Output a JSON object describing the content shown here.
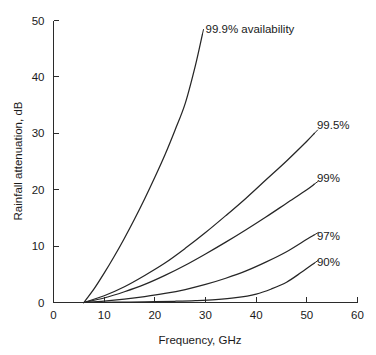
{
  "chart_data": {
    "type": "line",
    "title": "",
    "xlabel": "Frequency, GHz",
    "ylabel": "Rainfall attenuation, dB",
    "xlim": [
      0,
      60
    ],
    "ylim": [
      0,
      50
    ],
    "xticks": [
      0,
      10,
      20,
      30,
      40,
      50,
      60
    ],
    "yticks": [
      0,
      10,
      20,
      30,
      40,
      50
    ],
    "xtick_labels": [
      "0",
      "10",
      "20",
      "30",
      "40",
      "50",
      "60"
    ],
    "ytick_labels": [
      "0",
      "10",
      "20",
      "30",
      "40",
      "50"
    ],
    "grid": false,
    "legend_position": "inline-annotations",
    "series": [
      {
        "name": "99.9% availability",
        "label": "99.9% availability",
        "label_x": 30.0,
        "label_y": 48.5,
        "x": [
          6.0,
          8.0,
          10.0,
          12.0,
          14.0,
          16.0,
          18.0,
          20.0,
          22.0,
          24.0,
          26.0,
          28.0,
          29.4
        ],
        "y": [
          0.0,
          2.4,
          5.2,
          8.2,
          11.4,
          14.8,
          18.4,
          22.2,
          26.2,
          30.6,
          35.3,
          42.0,
          47.6
        ]
      },
      {
        "name": "99.5%",
        "label": "99.5%",
        "label_x": 52.0,
        "label_y": 31.5,
        "x": [
          6.0,
          10.0,
          14.0,
          18.0,
          22.0,
          26.0,
          30.0,
          34.0,
          38.0,
          42.0,
          46.0,
          50.0,
          51.5
        ],
        "y": [
          0.0,
          1.2,
          2.8,
          4.8,
          7.0,
          9.6,
          12.4,
          15.4,
          18.5,
          21.8,
          25.1,
          28.6,
          30.0
        ]
      },
      {
        "name": "99%",
        "label": "99%",
        "label_x": 52.0,
        "label_y": 22.0,
        "x": [
          6.0,
          10.0,
          14.0,
          18.0,
          22.0,
          26.0,
          30.0,
          34.0,
          38.0,
          42.0,
          46.0,
          50.0,
          51.5
        ],
        "y": [
          0.0,
          0.8,
          1.9,
          3.2,
          4.8,
          6.6,
          8.6,
          10.7,
          12.9,
          15.2,
          17.6,
          20.0,
          21.0
        ]
      },
      {
        "name": "97%",
        "label": "97%",
        "label_x": 52.0,
        "label_y": 11.8,
        "x": [
          6.0,
          10.0,
          14.0,
          18.0,
          22.0,
          26.0,
          30.0,
          34.0,
          38.0,
          42.0,
          46.0,
          50.0,
          51.5
        ],
        "y": [
          0.0,
          0.25,
          0.6,
          1.05,
          1.6,
          2.3,
          3.2,
          4.3,
          5.6,
          7.2,
          9.0,
          11.2,
          12.0
        ]
      },
      {
        "name": "90%",
        "label": "90%",
        "label_x": 52.0,
        "label_y": 7.2,
        "x": [
          6.0,
          12.0,
          18.0,
          24.0,
          28.0,
          32.0,
          36.0,
          40.0,
          43.0,
          46.0,
          49.0,
          51.5
        ],
        "y": [
          0.0,
          0.05,
          0.12,
          0.22,
          0.32,
          0.5,
          0.85,
          1.5,
          2.4,
          3.6,
          5.4,
          7.0
        ]
      }
    ]
  }
}
